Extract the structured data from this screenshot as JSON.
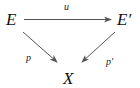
{
  "diagram": {
    "type": "commutative-triangle",
    "nodes": {
      "top_left": "E",
      "top_right": "E′",
      "bottom": "X"
    },
    "arrows": [
      {
        "from": "E",
        "to": "E′",
        "label": "u"
      },
      {
        "from": "E",
        "to": "X",
        "label": "p"
      },
      {
        "from": "E′",
        "to": "X",
        "label": "p′"
      }
    ],
    "colors": {
      "text": "#111111",
      "arrow": "#555555",
      "background": "#ffffff"
    }
  }
}
